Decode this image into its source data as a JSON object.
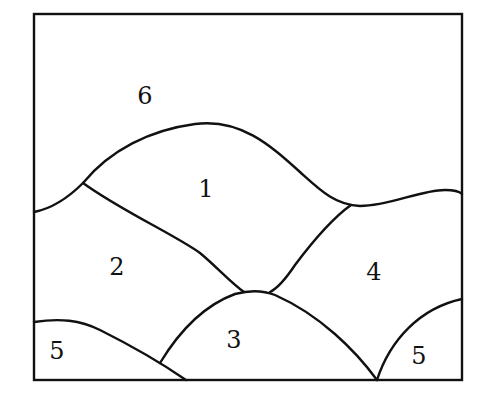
{
  "diagram": {
    "type": "planar region map",
    "frame": {
      "x": 34,
      "y": 14,
      "width": 428,
      "height": 366
    },
    "regions": [
      {
        "id": "region-1",
        "label": "1",
        "x": 206,
        "y": 190
      },
      {
        "id": "region-2",
        "label": "2",
        "x": 117,
        "y": 268
      },
      {
        "id": "region-3",
        "label": "3",
        "x": 234,
        "y": 341
      },
      {
        "id": "region-4",
        "label": "4",
        "x": 374,
        "y": 273
      },
      {
        "id": "region-5-left",
        "label": "5",
        "x": 57,
        "y": 352
      },
      {
        "id": "region-5-right",
        "label": "5",
        "x": 419,
        "y": 357
      },
      {
        "id": "region-6",
        "label": "6",
        "x": 145,
        "y": 97
      }
    ],
    "line_color": "#111111",
    "background": "#ffffff"
  }
}
